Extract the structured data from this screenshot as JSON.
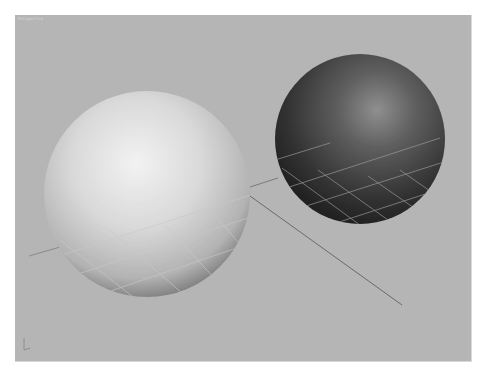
{
  "viewport": {
    "label": "Perspective",
    "background": "#b5b5b5",
    "view_type": "3D perspective viewport"
  },
  "scene": {
    "objects": [
      {
        "name": "Sphere (light)",
        "shading": "light gray",
        "color": "#d8d8d8"
      },
      {
        "name": "Sphere (dark)",
        "shading": "dark gray",
        "color": "#3a3a3a"
      }
    ],
    "grid": {
      "visible": true,
      "line_color": "#9a9a9a"
    },
    "axis_gizmo": {
      "visible": true
    }
  }
}
